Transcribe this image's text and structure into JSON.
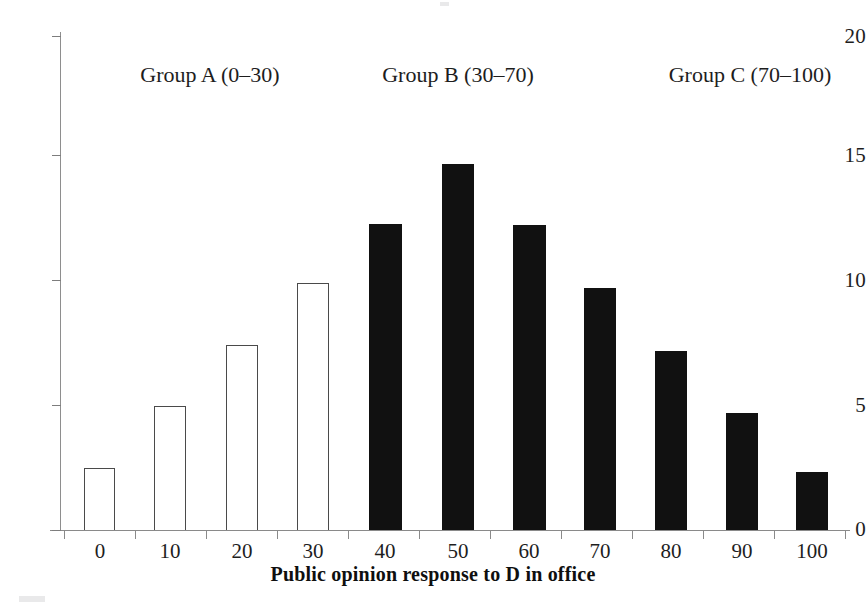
{
  "chart_data": {
    "type": "bar",
    "title": "",
    "xlabel": "Public opinion response to D in office",
    "ylabel": "",
    "categories": [
      "0",
      "10",
      "20",
      "30",
      "40",
      "50",
      "60",
      "70",
      "80",
      "90",
      "100"
    ],
    "values": [
      2.5,
      5.0,
      7.5,
      10.0,
      12.4,
      14.8,
      12.35,
      9.8,
      7.25,
      4.75,
      2.35
    ],
    "bar_styles": [
      "hollow",
      "hollow",
      "hollow",
      "hollow",
      "filled",
      "filled",
      "filled",
      "filled",
      "filled",
      "filled",
      "filled"
    ],
    "xlim": [
      -5,
      105
    ],
    "ylim": [
      0,
      20
    ],
    "ytick_values": [
      0,
      5,
      10,
      15,
      20
    ],
    "ytick_labels": [
      "0",
      "5",
      "10",
      "15",
      "20"
    ],
    "xtick_labels": [
      "0",
      "10",
      "20",
      "30",
      "40",
      "50",
      "60",
      "70",
      "80",
      "90",
      "100"
    ],
    "grid": false,
    "legend": false,
    "legend_position": "none",
    "annotations": [
      {
        "text": "Group A (0–30)",
        "group": "A",
        "range": "0–30",
        "center_x": 30
      },
      {
        "text": "Group B (30–70)",
        "group": "B",
        "range": "30–70",
        "center_x": 50
      },
      {
        "text": "Group C (70–100)",
        "group": "C",
        "range": "70–100",
        "center_x": 85
      }
    ],
    "colors": {
      "hollow_fill": "#ffffff",
      "hollow_stroke": "#4a4a4a",
      "filled": "#111111",
      "axis": "#8a8a8a",
      "text": "#1e1e1e",
      "background": "#ffffff"
    }
  },
  "axis": {
    "y_labels": [
      "20",
      "15",
      "10",
      "5",
      "0"
    ],
    "x_labels": [
      "0",
      "10",
      "20",
      "30",
      "40",
      "50",
      "60",
      "70",
      "80",
      "90",
      "100"
    ],
    "x_title": "Public opinion response to D in office"
  },
  "groups": {
    "a": "Group A (0–30)",
    "b": "Group B (30–70)",
    "c": "Group C (70–100)"
  }
}
